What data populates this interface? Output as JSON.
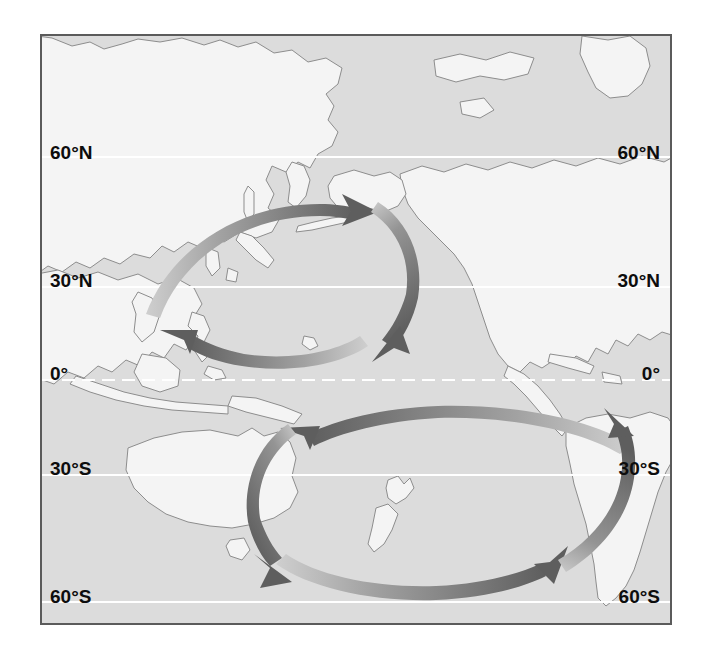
{
  "figure": {
    "kind": "map"
  },
  "colors": {
    "ocean": "#dcdcdc",
    "land": "#f4f4f4",
    "land_outline": "#8d8d8d",
    "frame_border": "#5b5b5b",
    "graticule": "#ffffff",
    "arrow_dark": "#5e5e5e",
    "arrow_mid": "#8f8f8f",
    "arrow_light": "#cfcfcf",
    "label_text": "#0d0d0d",
    "page_background": "#ffffff"
  },
  "graticule": {
    "line_color": "#ffffff",
    "equator_style": "dashed",
    "other_style": "solid",
    "latitudes": [
      {
        "id": "lat-60n",
        "label": "60°N",
        "y": 155,
        "style": "solid"
      },
      {
        "id": "lat-30n",
        "label": "30°N",
        "y": 285,
        "style": "solid"
      },
      {
        "id": "lat-0",
        "label": "0°",
        "y": 378,
        "style": "dashed"
      },
      {
        "id": "lat-30s",
        "label": "30°S",
        "y": 473,
        "style": "solid"
      },
      {
        "id": "lat-60s",
        "label": "60°S",
        "y": 600,
        "style": "solid"
      }
    ]
  },
  "labels": {
    "left": [
      {
        "text": "60°N",
        "y": 145
      },
      {
        "text": "30°N",
        "y": 272
      },
      {
        "text": "0°",
        "y": 366
      },
      {
        "text": "30°S",
        "y": 460
      },
      {
        "text": "60°S",
        "y": 588
      }
    ],
    "right": [
      {
        "text": "60°N",
        "y": 145
      },
      {
        "text": "30°N",
        "y": 272
      },
      {
        "text": "0°",
        "y": 366
      },
      {
        "text": "30°S",
        "y": 460
      },
      {
        "text": "60°S",
        "y": 588
      }
    ]
  },
  "gyres": [
    {
      "id": "north-pacific-gyre",
      "name": "North Pacific Gyre",
      "rotation": "clockwise",
      "hemisphere": "north",
      "center": {
        "x": 285,
        "y": 270
      },
      "segments": [
        {
          "id": "north-gyre-top-arrow",
          "direction": "eastward",
          "arrowhead": "right"
        },
        {
          "id": "north-gyre-right-arrow",
          "direction": "southward",
          "arrowhead": "down-left"
        },
        {
          "id": "north-gyre-bottom-arrow",
          "direction": "westward",
          "arrowhead": "left"
        }
      ]
    },
    {
      "id": "south-pacific-gyre",
      "name": "South Pacific Gyre",
      "rotation": "counter-clockwise",
      "hemisphere": "south",
      "center": {
        "x": 390,
        "y": 490
      },
      "segments": [
        {
          "id": "south-gyre-top-arrow",
          "direction": "westward",
          "arrowhead": "left"
        },
        {
          "id": "south-gyre-left-arrow",
          "direction": "southward",
          "arrowhead": "down-right"
        },
        {
          "id": "south-gyre-bottom-arrow",
          "direction": "eastward",
          "arrowhead": "right"
        },
        {
          "id": "south-gyre-right-arrow",
          "direction": "northward",
          "arrowhead": "up"
        }
      ]
    }
  ],
  "landmasses": [
    {
      "id": "eurasia-siberia",
      "name": "Eurasia / Siberia"
    },
    {
      "id": "japan",
      "name": "Japan"
    },
    {
      "id": "southeast-asia",
      "name": "Southeast Asia and Indonesia"
    },
    {
      "id": "philippines",
      "name": "Philippines"
    },
    {
      "id": "australia",
      "name": "Australia"
    },
    {
      "id": "tasmania",
      "name": "Tasmania"
    },
    {
      "id": "new-zealand",
      "name": "New Zealand"
    },
    {
      "id": "north-america",
      "name": "North America"
    },
    {
      "id": "alaska",
      "name": "Alaska"
    },
    {
      "id": "central-america",
      "name": "Central America"
    },
    {
      "id": "south-america",
      "name": "South America"
    },
    {
      "id": "caribbean",
      "name": "Caribbean islands"
    },
    {
      "id": "greenland",
      "name": "Greenland"
    },
    {
      "id": "new-guinea",
      "name": "New Guinea"
    }
  ]
}
